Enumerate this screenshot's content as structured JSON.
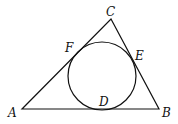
{
  "diagram": {
    "stroke_color": "#111111",
    "vertices": {
      "A": {
        "label": "A",
        "x": 22,
        "y": 109
      },
      "B": {
        "label": "B",
        "x": 159,
        "y": 109
      },
      "C": {
        "label": "C",
        "x": 111,
        "y": 19
      }
    },
    "incircle": {
      "cx": 102,
      "cy": 76,
      "r": 34
    },
    "tangent_points": {
      "D": {
        "label": "D",
        "on": "AB"
      },
      "E": {
        "label": "E",
        "on": "BC"
      },
      "F": {
        "label": "F",
        "on": "AC"
      }
    }
  }
}
